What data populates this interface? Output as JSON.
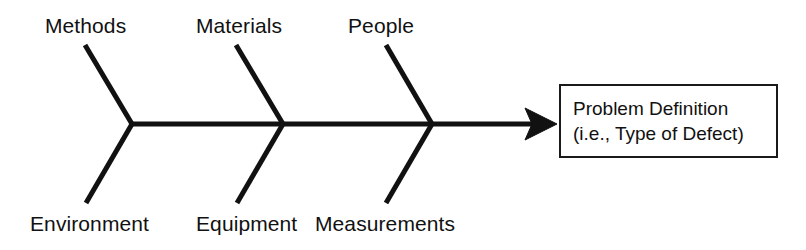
{
  "diagram": {
    "type": "fishbone-ishikawa-cause-and-effect",
    "background_color": "#ffffff",
    "line_color": "#111111",
    "spine": {
      "label": "spine",
      "start_x": 132,
      "end_x": 557,
      "y": 124,
      "thickness": 5,
      "arrowhead": "right-pointing-barbed-triangle"
    },
    "categories_top": [
      {
        "label": "Methods",
        "label_x": 45,
        "label_y": 14,
        "rib": {
          "x1": 85,
          "y1": 45,
          "x2": 132,
          "y2": 124
        }
      },
      {
        "label": "Materials",
        "label_x": 196,
        "label_y": 14,
        "rib": {
          "x1": 236,
          "y1": 45,
          "x2": 283,
          "y2": 124
        }
      },
      {
        "label": "People",
        "label_x": 348,
        "label_y": 14,
        "rib": {
          "x1": 386,
          "y1": 45,
          "x2": 432,
          "y2": 124
        }
      }
    ],
    "categories_bottom": [
      {
        "label": "Environment",
        "label_x": 30,
        "label_y": 212,
        "rib": {
          "x1": 132,
          "y1": 124,
          "x2": 86,
          "y2": 203
        }
      },
      {
        "label": "Equipment",
        "label_x": 196,
        "label_y": 212,
        "rib": {
          "x1": 283,
          "y1": 124,
          "x2": 237,
          "y2": 203
        }
      },
      {
        "label": "Measurements",
        "label_x": 315,
        "label_y": 212,
        "rib": {
          "x1": 432,
          "y1": 124,
          "x2": 386,
          "y2": 203
        }
      }
    ],
    "effect_box": {
      "line1": "Problem Definition",
      "line2": "(i.e., Type of Defect)",
      "x": 559,
      "y": 84,
      "width": 219,
      "height": 74,
      "border_color": "#1a1a1a",
      "fill_color": "#ffffff"
    }
  }
}
